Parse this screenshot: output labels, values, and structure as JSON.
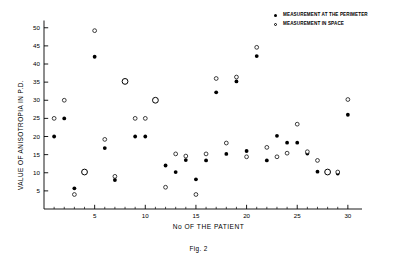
{
  "chart_data": {
    "type": "scatter",
    "title": "",
    "caption": "Fig. 2",
    "xlabel": "No OF THE PATIENT",
    "ylabel": "VALUE OF ANISOTROPIA IN P.D.",
    "xlim": [
      0,
      31
    ],
    "ylim": [
      0,
      52
    ],
    "xticks": [
      5,
      10,
      15,
      20,
      25,
      30
    ],
    "yticks": [
      5,
      10,
      15,
      20,
      25,
      30,
      35,
      40,
      45,
      50
    ],
    "minor_xtick_step": 1,
    "grid": false,
    "legend_position": "top-right",
    "legend": [
      {
        "key": "perimeter",
        "label": "MEASUREMENT AT THE PERIMETER",
        "marker": "filled-circle"
      },
      {
        "key": "space",
        "label": "MEASUREMENT IN SPACE",
        "marker": "open-circle"
      }
    ],
    "series": [
      {
        "name": "MEASUREMENT AT THE PERIMETER",
        "marker": "filled-circle",
        "x": [
          1,
          2,
          3,
          4,
          5,
          6,
          7,
          8,
          9,
          10,
          11,
          12,
          13,
          14,
          15,
          16,
          17,
          18,
          19,
          20,
          21,
          22,
          23,
          24,
          25,
          26,
          27,
          28,
          29,
          30
        ],
        "y": [
          20,
          25,
          5.7,
          10.2,
          42,
          16.8,
          8,
          35.2,
          20,
          20,
          30,
          12,
          10.2,
          13.5,
          8.2,
          13.4,
          32.2,
          15.2,
          35.2,
          16,
          42.2,
          13.4,
          20.2,
          18.3,
          18.3,
          15.3,
          10.3,
          10.2,
          9.8,
          26
        ]
      },
      {
        "name": "MEASUREMENT IN SPACE",
        "marker": "open-circle",
        "x": [
          1,
          2,
          3,
          4,
          5,
          6,
          7,
          8,
          9,
          10,
          11,
          12,
          13,
          14,
          15,
          16,
          17,
          18,
          19,
          20,
          21,
          22,
          23,
          24,
          25,
          26,
          27,
          28,
          29,
          30
        ],
        "y": [
          25,
          30,
          4,
          10.2,
          49.2,
          19.2,
          9,
          35.2,
          25,
          25,
          30,
          6,
          15.2,
          14.6,
          4,
          15.2,
          36,
          18.2,
          36.4,
          14.4,
          44.6,
          17,
          14.4,
          15.4,
          23.4,
          15.8,
          13.4,
          10.2,
          10.2,
          30.2
        ]
      }
    ]
  }
}
